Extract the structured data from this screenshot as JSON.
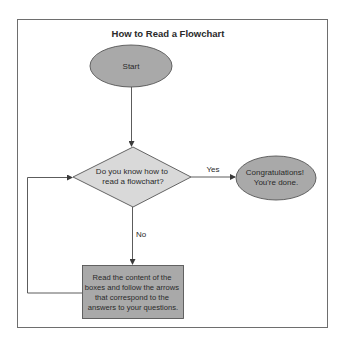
{
  "title": "How to Read a Flowchart",
  "nodes": {
    "start": {
      "label": "Start",
      "shape": "ellipse",
      "fill": "#a9a9a9"
    },
    "decision": {
      "lines": [
        "Do you know how to",
        "read a flowchart?"
      ],
      "shape": "diamond",
      "fill": "#d9d9d9"
    },
    "done": {
      "lines": [
        "Congratulations!",
        "You're done."
      ],
      "shape": "ellipse",
      "fill": "#a9a9a9"
    },
    "process": {
      "lines": [
        "Read the content of the",
        "boxes and follow the arrows",
        "that correspond to the",
        "answers to your questions."
      ],
      "shape": "rectangle",
      "fill": "#a9a9a9"
    }
  },
  "edges": {
    "yes_label": "Yes",
    "no_label": "No"
  },
  "colors": {
    "frame": "#6e6e6e",
    "line": "#4a4a4a",
    "text": "#2a2a2a"
  }
}
